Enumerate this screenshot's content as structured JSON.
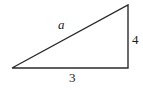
{
  "figure": {
    "background_color": "#ffffff",
    "stroke_color": "#2b2b2b",
    "stroke_width": 1.4,
    "geometry": {
      "left_vertex": [
        12,
        68
      ],
      "bottom_right_vertex": [
        128,
        68
      ],
      "top_right_vertex": [
        128,
        5
      ],
      "base_length_px": 116,
      "vertical_length_px": 63
    },
    "labels": {
      "hypotenuse": "a",
      "vertical_side": "4",
      "base_side": "3"
    }
  },
  "chart_data": {
    "type": "diagram",
    "title": "",
    "shape": "right triangle",
    "sides": [
      {
        "name": "base",
        "label": "3",
        "value": 3,
        "position": "bottom"
      },
      {
        "name": "vertical",
        "label": "4",
        "value": 4,
        "position": "right"
      },
      {
        "name": "hypotenuse",
        "label": "a",
        "value": null,
        "position": "upper-left-diagonal"
      }
    ]
  }
}
